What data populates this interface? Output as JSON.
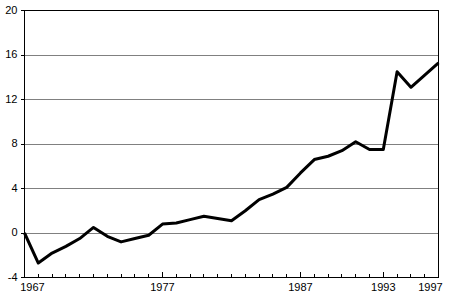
{
  "chart_data": {
    "type": "line",
    "title": "",
    "subtitle": "",
    "xlabel": "",
    "ylabel": "",
    "grid": true,
    "legend": false,
    "legend_position": "none",
    "xlim": [
      1967,
      1997
    ],
    "ylim": [
      -4,
      20
    ],
    "y_ticks": [
      -4,
      0,
      4,
      8,
      12,
      16,
      20
    ],
    "y_tick_labels": [
      "-4",
      "0",
      "4",
      "8",
      "12",
      "16",
      "20"
    ],
    "x_tick_labels": [
      "1967",
      "1977",
      "1987",
      "1993",
      "1997"
    ],
    "x_tick_label_years": [
      1967,
      1977,
      1987,
      1993,
      1997
    ],
    "x_tick_years_all": [
      1967,
      1968,
      1969,
      1970,
      1971,
      1972,
      1973,
      1974,
      1975,
      1976,
      1977,
      1978,
      1979,
      1980,
      1981,
      1982,
      1983,
      1984,
      1985,
      1986,
      1987,
      1988,
      1989,
      1990,
      1991,
      1992,
      1993,
      1994,
      1995,
      1996,
      1997
    ],
    "line_color": "#000000",
    "grid_color": "#808080",
    "axis_color": "#000000",
    "background_color": "#ffffff",
    "x": [
      1967,
      1968,
      1969,
      1970,
      1971,
      1972,
      1973,
      1974,
      1975,
      1976,
      1977,
      1978,
      1979,
      1980,
      1981,
      1982,
      1983,
      1984,
      1985,
      1986,
      1987,
      1988,
      1989,
      1990,
      1991,
      1992,
      1993,
      1994,
      1995,
      1996,
      1997
    ],
    "values": [
      0.0,
      -2.7,
      -1.8,
      -1.2,
      -0.5,
      0.5,
      -0.3,
      -0.8,
      -0.5,
      -0.2,
      0.8,
      0.9,
      1.2,
      1.5,
      1.3,
      1.1,
      2.0,
      3.0,
      3.5,
      4.1,
      5.4,
      6.6,
      6.9,
      7.4,
      8.2,
      7.5,
      7.5,
      14.5,
      13.1,
      14.2,
      15.3
    ],
    "series": [
      {
        "name": "series-1",
        "values": [
          0.0,
          -2.7,
          -1.8,
          -1.2,
          -0.5,
          0.5,
          -0.3,
          -0.8,
          -0.5,
          -0.2,
          0.8,
          0.9,
          1.2,
          1.5,
          1.3,
          1.1,
          2.0,
          3.0,
          3.5,
          4.1,
          5.4,
          6.6,
          6.9,
          7.4,
          8.2,
          7.5,
          7.5,
          14.5,
          13.1,
          14.2,
          15.3
        ]
      }
    ]
  }
}
